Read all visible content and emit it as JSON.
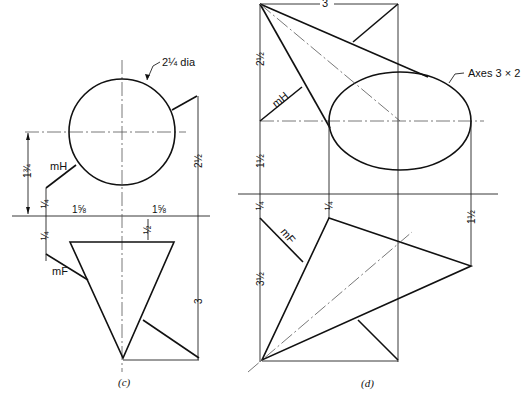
{
  "figure_c": {
    "caption": "(c)",
    "circle_label": "2¼ dia",
    "plane_h_label": "mH",
    "plane_f_label": "mF",
    "dim_vertical_left": "1¾",
    "dim_quarter_above": "¼",
    "dim_quarter_below": "¼",
    "dim_horizontal_left": "1⅝",
    "dim_horizontal_right": "1⅝",
    "dim_gap_triangle": "½",
    "dim_right_upper": "2½",
    "dim_right_lower": "3"
  },
  "figure_d": {
    "caption": "(d)",
    "ellipse_label": "Axes 3 × 2",
    "plane_h_label": "mH",
    "plane_f_label": "mF",
    "dim_top": "3",
    "dim_left_upper": "2½",
    "dim_left_middle": "1½",
    "dim_left_quarter": "¼",
    "dim_mid_quarter": "¼",
    "dim_left_lower": "3½",
    "dim_right_lower": "1½"
  }
}
